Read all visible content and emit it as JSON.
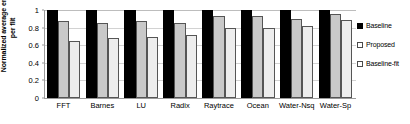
{
  "chart_data": {
    "type": "bar",
    "title": "",
    "xlabel": "",
    "ylabel": "Normalized average energy per flit",
    "ylim": [
      0,
      1
    ],
    "yticks": [
      "0",
      "0.2",
      "0.4",
      "0.6",
      "0.8",
      "1"
    ],
    "ytick_values": [
      0,
      0.2,
      0.4,
      0.6,
      0.8,
      1
    ],
    "grid": true,
    "legend_position": "right",
    "categories": [
      "FFT",
      "Barnes",
      "LU",
      "Radix",
      "Raytrace",
      "Ocean",
      "Water-Nsq",
      "Water-Sp"
    ],
    "series": [
      {
        "name": "Baseline",
        "color": "#000000",
        "values": [
          1.0,
          1.0,
          1.0,
          1.0,
          1.0,
          1.0,
          1.0,
          1.0
        ]
      },
      {
        "name": "Proposed",
        "color": "#c9c9c9",
        "values": [
          0.87,
          0.855,
          0.88,
          0.85,
          0.93,
          0.93,
          0.9,
          0.955
        ]
      },
      {
        "name": "Baseline-fit",
        "color": "#ededed",
        "values": [
          0.65,
          0.685,
          0.695,
          0.72,
          0.8,
          0.79,
          0.82,
          0.885
        ]
      }
    ]
  },
  "legend": {
    "items": [
      {
        "label": "Baseline"
      },
      {
        "label": "Proposed"
      },
      {
        "label": "Baseline-fit"
      }
    ]
  }
}
